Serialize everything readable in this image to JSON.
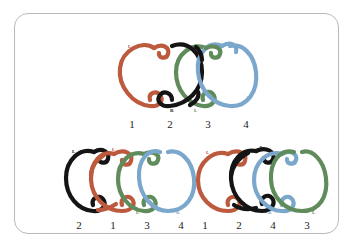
{
  "canvas": {
    "width": 352,
    "height": 247,
    "background": "#ffffff"
  },
  "card": {
    "border_color": "#b9b9b9",
    "background": "#ffffff",
    "corner_radius": 14
  },
  "palette": {
    "red": "#bd5a3e",
    "green": "#5f8c5a",
    "blue": "#7ba7cc",
    "black": "#141414"
  },
  "figures": [
    {
      "id": "top",
      "name": "top-knot-diagram",
      "strand_count": 4,
      "strand_colors": [
        "#bd5a3e",
        "#141414",
        "#5f8c5a",
        "#7ba7cc"
      ],
      "position_labels": [
        "1",
        "2",
        "3",
        "4"
      ],
      "endpoint_markers": [
        {
          "text": "L",
          "color": "#bd5a3e",
          "x": 18,
          "y": 12
        },
        {
          "text": "R",
          "color": "#141414",
          "x": 60,
          "y": 73
        },
        {
          "text": "L",
          "color": "#5f8c5a",
          "x": 84,
          "y": 73
        },
        {
          "text": "R",
          "color": "#7ba7cc",
          "x": 137,
          "y": 63
        }
      ]
    },
    {
      "id": "bottom-left",
      "name": "bottom-left-knot-diagram",
      "strand_count": 4,
      "strand_colors": [
        "#141414",
        "#bd5a3e",
        "#5f8c5a",
        "#7ba7cc"
      ],
      "position_labels": [
        "2",
        "1",
        "3",
        "4"
      ],
      "endpoint_markers": [
        {
          "text": "L",
          "color": "#141414",
          "x": 12,
          "y": 8
        },
        {
          "text": "L",
          "color": "#bd5a3e",
          "x": 50,
          "y": 6
        },
        {
          "text": "L",
          "color": "#5f8c5a",
          "x": 76,
          "y": 68
        },
        {
          "text": "R",
          "color": "#7ba7cc",
          "x": 116,
          "y": 70
        }
      ]
    },
    {
      "id": "bottom-right",
      "name": "bottom-right-knot-diagram",
      "strand_count": 4,
      "strand_colors": [
        "#bd5a3e",
        "#141414",
        "#7ba7cc",
        "#5f8c5a"
      ],
      "position_labels": [
        "1",
        "2",
        "4",
        "3"
      ],
      "endpoint_markers": [
        {
          "text": "L",
          "color": "#bd5a3e",
          "x": 16,
          "y": 10
        },
        {
          "text": "L",
          "color": "#141414",
          "x": 72,
          "y": 5
        },
        {
          "text": "R",
          "color": "#7ba7cc",
          "x": 78,
          "y": 70
        },
        {
          "text": "L",
          "color": "#5f8c5a",
          "x": 122,
          "y": 70
        }
      ]
    }
  ]
}
